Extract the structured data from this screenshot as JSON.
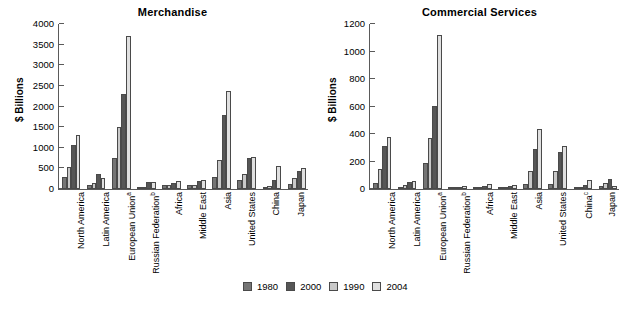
{
  "ylabel_text": "$ Billions",
  "legend": {
    "entries": [
      {
        "label": "1980",
        "color": "#757575"
      },
      {
        "label": "1990",
        "color": "#c9c9c9"
      },
      {
        "label": "2000",
        "color": "#565656"
      },
      {
        "label": "2004",
        "color": "#e0e0e0"
      }
    ]
  },
  "chart_data": [
    {
      "type": "bar",
      "title": "Merchandise",
      "xlabel": "",
      "ylabel": "$ Billions",
      "ylim": [
        0,
        4000
      ],
      "yticks": [
        0,
        500,
        1000,
        1500,
        2000,
        2500,
        3000,
        3500,
        4000
      ],
      "grid": false,
      "legend_position": "bottom-center",
      "categories": [
        "North America",
        "Latin America",
        "European Union a",
        "Russian Federation b",
        "Africa",
        "Middle East",
        "Asia",
        "United States",
        "China",
        "Japan"
      ],
      "category_labels": [
        {
          "text": "North America",
          "sup": ""
        },
        {
          "text": "Latin America",
          "sup": ""
        },
        {
          "text": "European Union",
          "sup": "a"
        },
        {
          "text": "Russian Federation",
          "sup": "b"
        },
        {
          "text": "Africa",
          "sup": ""
        },
        {
          "text": "Middle East",
          "sup": ""
        },
        {
          "text": "Asia",
          "sup": ""
        },
        {
          "text": "United States",
          "sup": ""
        },
        {
          "text": "China",
          "sup": ""
        },
        {
          "text": "Japan",
          "sup": ""
        }
      ],
      "series": [
        {
          "name": "1980",
          "color": "#757575",
          "values": [
            303,
            107,
            750,
            20,
            94,
            95,
            300,
            216,
            18,
            124
          ]
        },
        {
          "name": "1990",
          "color": "#c9c9c9",
          "values": [
            522,
            139,
            1500,
            45,
            92,
            92,
            715,
            368,
            62,
            265
          ]
        },
        {
          "name": "2000",
          "color": "#565656",
          "values": [
            1057,
            358,
            2315,
            160,
            146,
            185,
            1805,
            753,
            225,
            446
          ]
        },
        {
          "name": "2004",
          "color": "#e0e0e0",
          "values": [
            1320,
            275,
            3700,
            180,
            195,
            215,
            2370,
            786,
            560,
            520
          ]
        }
      ]
    },
    {
      "type": "bar",
      "title": "Commercial Services",
      "xlabel": "",
      "ylabel": "$ Billions",
      "ylim": [
        0,
        1200
      ],
      "yticks": [
        0,
        200,
        400,
        600,
        800,
        1000,
        1200
      ],
      "grid": false,
      "legend_position": "bottom-center",
      "categories": [
        "North America",
        "Latin America",
        "European Union a",
        "Russian Federation b",
        "Africa",
        "Middle East",
        "Asia",
        "United States",
        "China",
        "Japan"
      ],
      "category_labels": [
        {
          "text": "North America",
          "sup": ""
        },
        {
          "text": "Latin America",
          "sup": ""
        },
        {
          "text": "European Union",
          "sup": "a"
        },
        {
          "text": "Russian Federation",
          "sup": "b"
        },
        {
          "text": "Africa",
          "sup": ""
        },
        {
          "text": "Middle East",
          "sup": ""
        },
        {
          "text": "Asia",
          "sup": ""
        },
        {
          "text": "United States",
          "sup": ""
        },
        {
          "text": "China",
          "sup": "c"
        },
        {
          "text": "Japan",
          "sup": ""
        }
      ],
      "series": [
        {
          "name": "1980",
          "color": "#757575",
          "values": [
            45,
            15,
            190,
            5,
            12,
            18,
            35,
            35,
            4,
            22
          ]
        },
        {
          "name": "1990",
          "color": "#c9c9c9",
          "values": [
            148,
            28,
            370,
            10,
            18,
            15,
            128,
            128,
            6,
            42
          ]
        },
        {
          "name": "2000",
          "color": "#565656",
          "values": [
            315,
            48,
            605,
            12,
            22,
            25,
            292,
            270,
            32,
            70
          ]
        },
        {
          "name": "2004",
          "color": "#e0e0e0",
          "values": [
            378,
            58,
            1120,
            22,
            35,
            30,
            440,
            310,
            65,
            22
          ]
        }
      ]
    }
  ]
}
